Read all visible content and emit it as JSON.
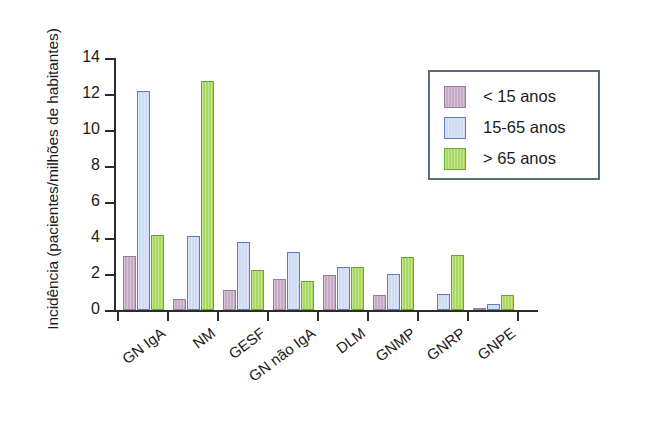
{
  "chart_data": {
    "type": "bar",
    "title": "",
    "subtitle": "",
    "xlabel": "",
    "ylabel": "Incidência (pacientes/milhões de habitantes)",
    "categories": [
      "GN IgA",
      "NM",
      "GESF",
      "GN não IgA",
      "DLM",
      "GNMP",
      "GNRP",
      "GNPE"
    ],
    "series": [
      {
        "name": "< 15 anos",
        "color": "#c6a9c4",
        "border": "#9b7c9b",
        "values": [
          3.0,
          0.6,
          1.1,
          1.75,
          1.95,
          0.85,
          0.0,
          0.1
        ]
      },
      {
        "name": "15-65 anos",
        "color": "#cfdbf2",
        "border": "#577fbe",
        "values": [
          12.15,
          4.1,
          3.8,
          3.25,
          2.4,
          2.0,
          0.9,
          0.35
        ]
      },
      {
        "name": "> 65 anos",
        "color": "#aad962",
        "border": "#6aa731",
        "values": [
          4.15,
          12.75,
          2.25,
          1.6,
          2.4,
          2.95,
          3.05,
          0.85
        ]
      }
    ],
    "ylim": [
      0,
      14
    ],
    "yticks": [
      0,
      2,
      4,
      6,
      8,
      10,
      12,
      14
    ],
    "ytick_labels": [
      "0",
      "2",
      "4",
      "6",
      "8",
      "10",
      "12",
      "14"
    ],
    "grid": false,
    "legend_position": "upper-right",
    "legend_entries": [
      "< 15 anos",
      "15-65 anos",
      "> 65 anos"
    ],
    "annotations": []
  }
}
